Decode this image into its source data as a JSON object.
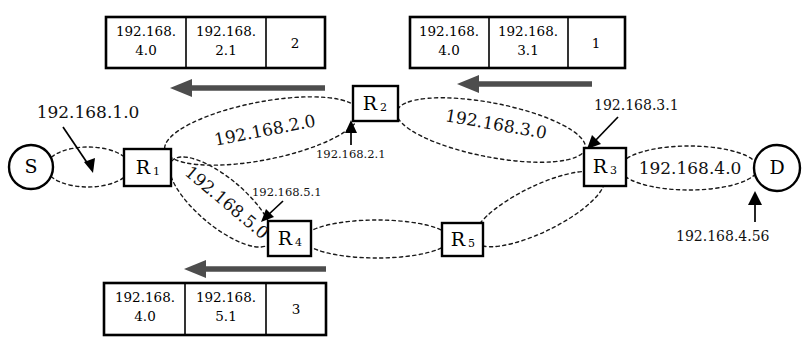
{
  "diagram": {
    "nodes": [
      {
        "id": "S",
        "label": "S",
        "shape": "circle",
        "cx": 31,
        "cy": 167,
        "r": 22
      },
      {
        "id": "R1",
        "label": "R",
        "sub": "1",
        "shape": "box",
        "x": 124,
        "y": 149,
        "w": 47,
        "h": 37
      },
      {
        "id": "R2",
        "label": "R",
        "sub": "2",
        "shape": "box",
        "x": 353,
        "y": 86,
        "w": 45,
        "h": 35
      },
      {
        "id": "R3",
        "label": "R",
        "sub": "3",
        "shape": "box",
        "x": 584,
        "y": 148,
        "w": 42,
        "h": 38
      },
      {
        "id": "R4",
        "label": "R",
        "sub": "4",
        "shape": "box",
        "x": 268,
        "y": 221,
        "w": 43,
        "h": 35
      },
      {
        "id": "R5",
        "label": "R",
        "sub": "5",
        "shape": "box",
        "x": 442,
        "y": 223,
        "w": 41,
        "h": 33
      },
      {
        "id": "D",
        "label": "D",
        "shape": "circle",
        "cx": 777,
        "cy": 168,
        "r": 23
      }
    ],
    "links": [
      {
        "id": "link-s-r1",
        "network": "192.168.1.0",
        "from": "S",
        "to": "R1"
      },
      {
        "id": "link-r1-r2",
        "network": "192.168.2.0",
        "from": "R1",
        "to": "R2"
      },
      {
        "id": "link-r2-r3",
        "network": "192.168.3.0",
        "from": "R2",
        "to": "R3"
      },
      {
        "id": "link-r3-d",
        "network": "192.168.4.0",
        "from": "R3",
        "to": "D"
      },
      {
        "id": "link-r1-r4",
        "network": "192.168.5.0",
        "from": "R1",
        "to": "R4"
      },
      {
        "id": "link-r4-r5",
        "network": "",
        "from": "R4",
        "to": "R5"
      },
      {
        "id": "link-r5-r3",
        "network": "",
        "from": "R5",
        "to": "R3"
      }
    ],
    "network_labels": {
      "net_1_0": "192.168.1.0",
      "net_2_0": "192.168.2.0",
      "net_3_0": "192.168.3.0",
      "net_4_0": "192.168.4.0",
      "net_5_0": "192.168.5.0"
    },
    "interface_labels": {
      "r2_iface": "192.168.2.1",
      "r3_iface": "192.168.3.1",
      "r4_iface": "192.168.5.1",
      "d_iface": "192.168.4.56"
    }
  },
  "tables": {
    "columns": [
      "destination",
      "next_hop",
      "interface"
    ],
    "entries": [
      {
        "id": "table-top-left",
        "destination_line1": "192.168.",
        "destination_line2": "4.0",
        "next_hop_line1": "192.168.",
        "next_hop_line2": "2.1",
        "interface": "2"
      },
      {
        "id": "table-top-right",
        "destination_line1": "192.168.",
        "destination_line2": "4.0",
        "next_hop_line1": "192.168.",
        "next_hop_line2": "3.1",
        "interface": "1"
      },
      {
        "id": "table-bottom-left",
        "destination_line1": "192.168.",
        "destination_line2": "5.1",
        "next_hop_line1": "192.168.",
        "next_hop_line2": "5.1",
        "interface": "3"
      }
    ],
    "bottom_left_override": {
      "destination_line1": "192.168.",
      "destination_line2": "4.0",
      "next_hop_line1": "192.168.",
      "next_hop_line2": "5.1",
      "interface": "3"
    }
  },
  "colors": {
    "stroke": "#000000",
    "arrow_gray": "#4d4d4d",
    "background": "#ffffff"
  }
}
